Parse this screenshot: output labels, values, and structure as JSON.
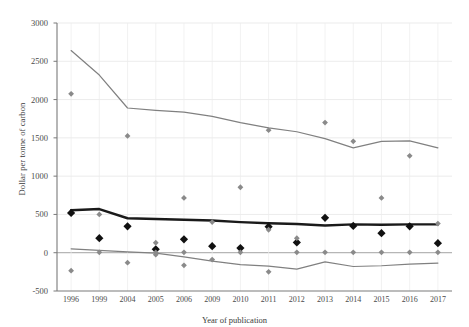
{
  "chart_data": {
    "type": "line",
    "title": "",
    "xlabel": "Year of publication",
    "ylabel": "Dollar per tonne of carbon",
    "categories": [
      "1996",
      "1999",
      "2004",
      "2005",
      "2006",
      "2009",
      "2010",
      "2011",
      "2012",
      "2013",
      "2014",
      "2015",
      "2016",
      "2017"
    ],
    "ylim": [
      -500,
      3000
    ],
    "yticks": [
      -500,
      0,
      500,
      1000,
      1500,
      2000,
      2500,
      3000
    ],
    "grid": true,
    "legend": "none",
    "series": [
      {
        "name": "Upper bound trend",
        "type": "line",
        "color": "#808080",
        "values": [
          2640,
          2320,
          1890,
          1860,
          1835,
          1780,
          1700,
          1630,
          1580,
          1490,
          1370,
          1455,
          1460,
          1370
        ]
      },
      {
        "name": "Central estimate trend",
        "type": "line",
        "color": "#1a1a1a",
        "values": [
          555,
          570,
          450,
          440,
          430,
          420,
          400,
          385,
          375,
          355,
          370,
          365,
          370,
          370
        ]
      },
      {
        "name": "Lower bound trend",
        "type": "line",
        "color": "#808080",
        "values": [
          50,
          30,
          10,
          -5,
          -55,
          -110,
          -155,
          -175,
          -215,
          -120,
          -180,
          -170,
          -150,
          -135
        ]
      },
      {
        "name": "Black diamond observations",
        "type": "scatter",
        "color": "#111111",
        "points": [
          {
            "x": "1996",
            "y": 520
          },
          {
            "x": "1999",
            "y": 190
          },
          {
            "x": "2004",
            "y": 345
          },
          {
            "x": "2005",
            "y": 45
          },
          {
            "x": "2006",
            "y": 175
          },
          {
            "x": "2009",
            "y": 85
          },
          {
            "x": "2010",
            "y": 60
          },
          {
            "x": "2011",
            "y": 340
          },
          {
            "x": "2012",
            "y": 135
          },
          {
            "x": "2013",
            "y": 455
          },
          {
            "x": "2014",
            "y": 350
          },
          {
            "x": "2015",
            "y": 255
          },
          {
            "x": "2016",
            "y": 345
          },
          {
            "x": "2017",
            "y": 125
          }
        ]
      },
      {
        "name": "Grey diamond observations",
        "type": "scatter",
        "color": "#8a8a8a",
        "points": [
          {
            "x": "1996",
            "y": 2075
          },
          {
            "x": "1996",
            "y": -235
          },
          {
            "x": "1999",
            "y": 500
          },
          {
            "x": "1999",
            "y": 5
          },
          {
            "x": "2004",
            "y": 1525
          },
          {
            "x": "2004",
            "y": -130
          },
          {
            "x": "2005",
            "y": 130
          },
          {
            "x": "2005",
            "y": 5
          },
          {
            "x": "2005",
            "y": -25
          },
          {
            "x": "2006",
            "y": 715
          },
          {
            "x": "2006",
            "y": 5
          },
          {
            "x": "2006",
            "y": -165
          },
          {
            "x": "2009",
            "y": 400
          },
          {
            "x": "2009",
            "y": -90
          },
          {
            "x": "2010",
            "y": 855
          },
          {
            "x": "2010",
            "y": 5
          },
          {
            "x": "2011",
            "y": 1600
          },
          {
            "x": "2011",
            "y": 300
          },
          {
            "x": "2011",
            "y": -250
          },
          {
            "x": "2012",
            "y": 190
          },
          {
            "x": "2012",
            "y": 5
          },
          {
            "x": "2013",
            "y": 1700
          },
          {
            "x": "2013",
            "y": 5
          },
          {
            "x": "2014",
            "y": 1455
          },
          {
            "x": "2014",
            "y": 5
          },
          {
            "x": "2015",
            "y": 715
          },
          {
            "x": "2015",
            "y": 5
          },
          {
            "x": "2016",
            "y": 1265
          },
          {
            "x": "2016",
            "y": 5
          },
          {
            "x": "2017",
            "y": 380
          },
          {
            "x": "2017",
            "y": 5
          }
        ]
      }
    ]
  }
}
